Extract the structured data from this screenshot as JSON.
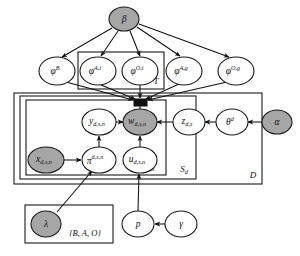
{
  "figure": {
    "type": "probabilistic-graphical-model-plate-diagram",
    "title": "",
    "background_color": "#ffffff",
    "shaded_node_color": "#a6a6a6",
    "open_node_color": "#ffffff",
    "stroke_color": "#111111"
  },
  "nodes": [
    {
      "id": "beta",
      "label": "β",
      "sup": "",
      "sub": "",
      "shaded": true,
      "cx": 124,
      "cy": 19,
      "rx": 15,
      "ry": 12
    },
    {
      "id": "phi_B",
      "label": "φ",
      "sup": "B",
      "sub": "",
      "shaded": false,
      "cx": 57,
      "cy": 71,
      "rx": 18,
      "ry": 14
    },
    {
      "id": "phi_At",
      "label": "φ",
      "sup": "A,t",
      "sub": "",
      "shaded": false,
      "cx": 98,
      "cy": 71,
      "rx": 18,
      "ry": 14
    },
    {
      "id": "phi_Ot",
      "label": "φ",
      "sup": "O,t",
      "sub": "",
      "shaded": false,
      "cx": 140,
      "cy": 71,
      "rx": 18,
      "ry": 14
    },
    {
      "id": "phi_Ag",
      "label": "φ",
      "sup": "A,g",
      "sub": "",
      "shaded": false,
      "cx": 184,
      "cy": 71,
      "rx": 18,
      "ry": 14
    },
    {
      "id": "phi_Og",
      "label": "φ",
      "sup": "O,g",
      "sub": "",
      "shaded": false,
      "cx": 236,
      "cy": 71,
      "rx": 18,
      "ry": 14
    },
    {
      "id": "y",
      "label": "y",
      "sup": "",
      "sub": "d,s,n",
      "shaded": false,
      "cx": 99,
      "cy": 122,
      "rx": 17,
      "ry": 13
    },
    {
      "id": "w",
      "label": "w",
      "sup": "",
      "sub": "d,s,n",
      "shaded": true,
      "cx": 140,
      "cy": 122,
      "rx": 17,
      "ry": 13
    },
    {
      "id": "z",
      "label": "z",
      "sup": "",
      "sub": "d,s",
      "shaded": false,
      "cx": 189,
      "cy": 122,
      "rx": 16,
      "ry": 13
    },
    {
      "id": "theta",
      "label": "θ",
      "sup": "d",
      "sub": "",
      "shaded": false,
      "cx": 232,
      "cy": 122,
      "rx": 16,
      "ry": 13
    },
    {
      "id": "alpha",
      "label": "α",
      "sup": "",
      "sub": "",
      "shaded": true,
      "cx": 277,
      "cy": 122,
      "rx": 15,
      "ry": 12
    },
    {
      "id": "x",
      "label": "x",
      "sup": "",
      "sub": "d,s,n",
      "shaded": true,
      "cx": 46,
      "cy": 160,
      "rx": 18,
      "ry": 13
    },
    {
      "id": "pi",
      "label": "π",
      "sup": "d,s,n",
      "sub": "",
      "shaded": false,
      "cx": 99,
      "cy": 160,
      "rx": 17,
      "ry": 13
    },
    {
      "id": "u",
      "label": "u",
      "sup": "",
      "sub": "d,s,n",
      "shaded": false,
      "cx": 140,
      "cy": 160,
      "rx": 17,
      "ry": 13
    },
    {
      "id": "lambda",
      "label": "λ",
      "sup": "",
      "sub": "",
      "shaded": true,
      "cx": 46,
      "cy": 224,
      "rx": 15,
      "ry": 13
    },
    {
      "id": "p",
      "label": "p",
      "sup": "",
      "sub": "",
      "shaded": false,
      "cx": 138,
      "cy": 224,
      "rx": 16,
      "ry": 13
    },
    {
      "id": "gamma",
      "label": "γ",
      "sup": "",
      "sub": "",
      "shaded": false,
      "cx": 181,
      "cy": 224,
      "rx": 16,
      "ry": 13
    }
  ],
  "gate": {
    "id": "w-gate",
    "x": 134,
    "y": 99,
    "width": 13,
    "height": 7
  },
  "plates": [
    {
      "id": "plate_T",
      "label": "T",
      "x": 78,
      "y": 52,
      "width": 86,
      "height": 37,
      "label_x": 156,
      "label_y": 82
    },
    {
      "id": "plate_D",
      "label": "D",
      "x": 14,
      "y": 93,
      "width": 248,
      "height": 91,
      "label_x": 253,
      "label_y": 176
    },
    {
      "id": "plate_Sd",
      "label": "S",
      "label_sub": "d",
      "x": 20,
      "y": 96,
      "width": 176,
      "height": 83,
      "label_x": 185,
      "label_y": 171
    },
    {
      "id": "plate_Nds",
      "label": "N",
      "label_sub": "d,s",
      "x": 26,
      "y": 100,
      "width": 140,
      "height": 75,
      "label_x": 150,
      "label_y": 168
    },
    {
      "id": "plate_lambda",
      "label": "",
      "x": 25,
      "y": 205,
      "width": 88,
      "height": 38,
      "label_x": 0,
      "label_y": 0
    }
  ],
  "set_label": {
    "id": "lambda-set-label",
    "text": "{B, A, O}",
    "x": 85,
    "y": 234
  },
  "plate_labels": {
    "T": "T",
    "D": "D",
    "Sd": "S",
    "Sd_sub": "d",
    "Nds": "N",
    "Nds_sub": "d,s"
  },
  "edges": [
    {
      "from": "beta",
      "to": "phi_B",
      "label": ""
    },
    {
      "from": "beta",
      "to": "phi_At",
      "label": ""
    },
    {
      "from": "beta",
      "to": "phi_Ot",
      "label": ""
    },
    {
      "from": "beta",
      "to": "phi_Ag",
      "label": ""
    },
    {
      "from": "beta",
      "to": "phi_Og",
      "label": ""
    },
    {
      "from": "phi_B",
      "to": "w-gate",
      "label": ""
    },
    {
      "from": "phi_At",
      "to": "w-gate",
      "label": ""
    },
    {
      "from": "phi_Ot",
      "to": "w-gate",
      "label": ""
    },
    {
      "from": "phi_Ag",
      "to": "w-gate",
      "label": ""
    },
    {
      "from": "phi_Og",
      "to": "w-gate",
      "label": ""
    },
    {
      "from": "y",
      "to": "w",
      "label": ""
    },
    {
      "from": "z",
      "to": "w",
      "label": ""
    },
    {
      "from": "theta",
      "to": "z",
      "label": ""
    },
    {
      "from": "alpha",
      "to": "theta",
      "label": ""
    },
    {
      "from": "pi",
      "to": "y",
      "label": ""
    },
    {
      "from": "x",
      "to": "pi",
      "label": ""
    },
    {
      "from": "u",
      "to": "w",
      "label": ""
    },
    {
      "from": "lambda",
      "to": "pi",
      "label": ""
    },
    {
      "from": "p",
      "to": "u",
      "label": ""
    },
    {
      "from": "gamma",
      "to": "p",
      "label": ""
    }
  ]
}
